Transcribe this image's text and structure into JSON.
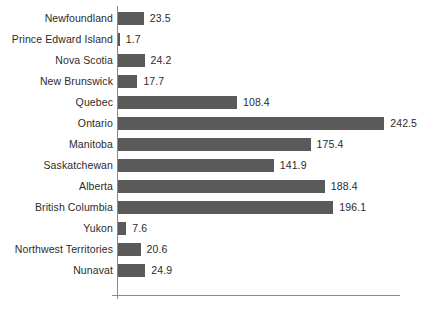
{
  "chart_data": {
    "type": "bar",
    "orientation": "horizontal",
    "title": "",
    "subtitle": "",
    "xlabel": "",
    "ylabel": "",
    "legend": [],
    "legend_position": "none",
    "grid": false,
    "xlim": [
      0,
      242.5
    ],
    "axis_origin_value": 0,
    "bar_color": "#5a5a5a",
    "axis_color": "#8a8a8a",
    "label_color": "#2b2b2b",
    "background_color": "#ffffff",
    "value_label_precision": 1,
    "categories": [
      "Newfoundland",
      "Prince Edward Island",
      "Nova Scotia",
      "New Brunswick",
      "Quebec",
      "Ontario",
      "Manitoba",
      "Saskatchewan",
      "Alberta",
      "British Columbia",
      "Yukon",
      "Northwest Territories",
      "Nunavat"
    ],
    "values": [
      23.5,
      1.7,
      24.2,
      17.7,
      108.4,
      242.5,
      175.4,
      141.9,
      188.4,
      196.1,
      7.6,
      20.6,
      24.9
    ],
    "value_labels": [
      "23.5",
      "1.7",
      "24.2",
      "17.7",
      "108.4",
      "242.5",
      "175.4",
      "141.9",
      "188.4",
      "196.1",
      "7.6",
      "20.6",
      "24.9"
    ],
    "rows": [
      {
        "label": "Newfoundland",
        "value": 23.5,
        "value_label": "23.5"
      },
      {
        "label": "Prince Edward Island",
        "value": 1.7,
        "value_label": "1.7"
      },
      {
        "label": "Nova Scotia",
        "value": 24.2,
        "value_label": "24.2"
      },
      {
        "label": "New Brunswick",
        "value": 17.7,
        "value_label": "17.7"
      },
      {
        "label": "Quebec",
        "value": 108.4,
        "value_label": "108.4"
      },
      {
        "label": "Ontario",
        "value": 242.5,
        "value_label": "242.5"
      },
      {
        "label": "Manitoba",
        "value": 175.4,
        "value_label": "175.4"
      },
      {
        "label": "Saskatchewan",
        "value": 141.9,
        "value_label": "141.9"
      },
      {
        "label": "Alberta",
        "value": 188.4,
        "value_label": "188.4"
      },
      {
        "label": "British Columbia",
        "value": 196.1,
        "value_label": "196.1"
      },
      {
        "label": "Yukon",
        "value": 7.6,
        "value_label": "7.6"
      },
      {
        "label": "Northwest Territories",
        "value": 20.6,
        "value_label": "20.6"
      },
      {
        "label": "Nunavat",
        "value": 24.9,
        "value_label": "24.9"
      }
    ]
  },
  "layout": {
    "row_pitch_px": 21,
    "first_row_top_px": 8,
    "bar_height_px": 13,
    "bar_origin_x_px": 118,
    "px_per_unit": 1.098,
    "label_right_edge_px": 113
  }
}
